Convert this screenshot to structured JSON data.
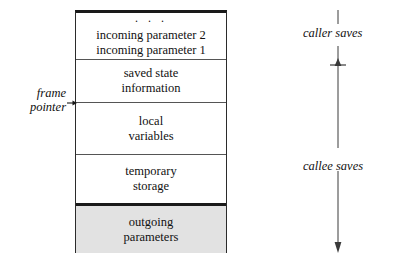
{
  "diagram": {
    "frame_sections": [
      {
        "name": "incoming-parameters",
        "dots": "· · ·",
        "line1": "incoming parameter 2",
        "line2": "incoming parameter 1",
        "shaded": false
      },
      {
        "name": "saved-state-information",
        "line1": "saved state",
        "line2": "information",
        "shaded": false
      },
      {
        "name": "local-variables",
        "line1": "local",
        "line2": "variables",
        "shaded": false
      },
      {
        "name": "temporary-storage",
        "line1": "temporary",
        "line2": "storage",
        "shaded": false
      },
      {
        "name": "outgoing-parameters",
        "line1": "outgoing",
        "line2": "parameters",
        "shaded": true
      }
    ],
    "frame_pointer": {
      "line1": "frame",
      "line2": "pointer"
    },
    "side_labels": {
      "caller": "caller saves",
      "callee": "callee saves"
    },
    "colors": {
      "ink": "#111111",
      "rule": "#555555",
      "heavy_rule": "#1a1a1a",
      "shaded_fill": "#e2e2e2",
      "background": "#ffffff"
    }
  }
}
